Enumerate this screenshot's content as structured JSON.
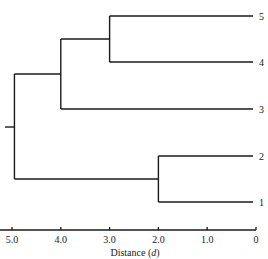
{
  "chart_data": {
    "type": "dendrogram",
    "title": "",
    "xlabel": "Distance (d)",
    "ylabel": "",
    "xlim": [
      5.0,
      0
    ],
    "x_direction": "reversed",
    "grid": false,
    "legend": null,
    "ticks": [
      {
        "value": 5.0,
        "label": "5.0"
      },
      {
        "value": 4.0,
        "label": "4.0"
      },
      {
        "value": 3.0,
        "label": "3.0"
      },
      {
        "value": 2.0,
        "label": "2.0"
      },
      {
        "value": 1.0,
        "label": "1.0"
      },
      {
        "value": 0,
        "label": "0"
      }
    ],
    "leaves": [
      {
        "id": "5",
        "label": "5",
        "order": 0
      },
      {
        "id": "4",
        "label": "4",
        "order": 1
      },
      {
        "id": "3",
        "label": "3",
        "order": 2
      },
      {
        "id": "2",
        "label": "2",
        "order": 3
      },
      {
        "id": "1",
        "label": "1",
        "order": 4
      }
    ],
    "merges": [
      {
        "id": "A",
        "children": [
          "5",
          "4"
        ],
        "distance": 3.0
      },
      {
        "id": "B",
        "children": [
          "A",
          "3"
        ],
        "distance": 4.0
      },
      {
        "id": "C",
        "children": [
          "2",
          "1"
        ],
        "distance": 2.0
      },
      {
        "id": "root",
        "children": [
          "B",
          "C"
        ],
        "distance": 4.95
      }
    ]
  },
  "axis": {
    "title": "Distance (d)",
    "title_prefix": "Distance (",
    "title_var": "d",
    "title_suffix": ")"
  },
  "colors": {
    "line": "#1a1a1a",
    "background": "#ffffff"
  }
}
